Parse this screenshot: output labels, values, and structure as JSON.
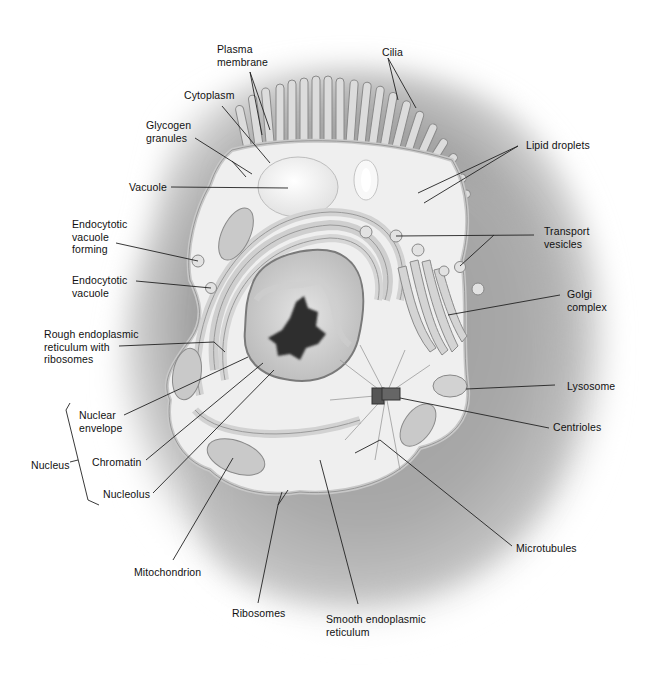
{
  "diagram": {
    "type": "labeled-illustration",
    "labels": {
      "plasma_membrane": "Plasma\nmembrane",
      "cilia": "Cilia",
      "cytoplasm": "Cytoplasm",
      "glycogen_granules": "Glycogen\ngranules",
      "lipid_droplets": "Lipid droplets",
      "vacuole": "Vacuole",
      "endocytotic_vacuole_forming": "Endocytotic\nvacuole\nforming",
      "transport_vesicles": "Transport\nvesicles",
      "endocytotic_vacuole": "Endocytotic\nvacuole",
      "golgi_complex": "Golgi\ncomplex",
      "rough_er": "Rough endoplasmic\nreticulum with\nribosomes",
      "lysosome": "Lysosome",
      "nuclear_envelope": "Nuclear\nenvelope",
      "centrioles": "Centrioles",
      "nucleus": "Nucleus",
      "chromatin": "Chromatin",
      "nucleolus": "Nucleolus",
      "microtubules": "Microtubules",
      "mitochondrion": "Mitochondrion",
      "ribosomes": "Ribosomes",
      "smooth_er": "Smooth endoplasmic\nreticulum"
    },
    "groupings": [
      {
        "name": "Nucleus",
        "members": [
          "Nuclear envelope",
          "Chromatin",
          "Nucleolus"
        ]
      }
    ],
    "colors": {
      "background": "#ffffff",
      "outer_shadow": "#9a9a9a",
      "cytoplasm": "#efefef",
      "membrane": "#d9d9d9",
      "organelle": "#bdbdbd",
      "nucleolus": "#2e2e2e",
      "leader_line": "#222222"
    }
  }
}
